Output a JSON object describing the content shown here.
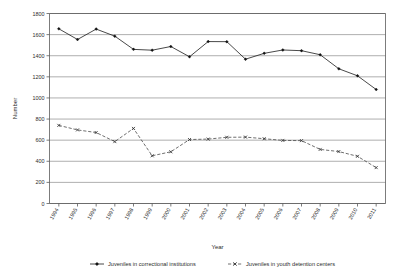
{
  "chart_data": {
    "type": "line",
    "title": "",
    "xlabel": "Year",
    "ylabel": "Number",
    "ylim": [
      0,
      1800
    ],
    "ytick_step": 200,
    "yticks": [
      0,
      200,
      400,
      600,
      800,
      1000,
      1200,
      1400,
      1600,
      1800
    ],
    "grid": true,
    "grid_axis": "y",
    "legend_position": "bottom",
    "categories": [
      "1994",
      "1995",
      "1996",
      "1997",
      "1998",
      "1999",
      "2000",
      "2001",
      "2002",
      "2003",
      "2004",
      "2005",
      "2006",
      "2007",
      "2008",
      "2009",
      "2010",
      "2011"
    ],
    "x": [
      "1994",
      "1995",
      "1996",
      "1997",
      "1998",
      "1999",
      "2000",
      "2001",
      "2002",
      "2003",
      "2004",
      "2005",
      "2006",
      "2007",
      "2008",
      "2009",
      "2010",
      "2011"
    ],
    "series": [
      {
        "name": "Juveniles in correctional institutions",
        "marker": "diamond",
        "line_style": "solid",
        "color": "#111111",
        "values": [
          1655,
          1575,
          1530,
          1660,
          1645,
          1500,
          1455,
          1440,
          1475,
          1490,
          1365,
          1450,
          1560,
          1605,
          1300,
          1395,
          1420,
          1435
        ]
      },
      {
        "name": "Juveniles in youth detention centers",
        "marker": "x",
        "line_style": "dashed",
        "color": "#333333",
        "values": [
          740,
          700,
          695,
          690,
          590,
          585,
          660,
          805,
          430,
          445,
          530,
          610,
          575,
          625,
          630,
          620,
          630,
          635
        ]
      }
    ],
    "series_extended_note": "",
    "annotations": []
  },
  "chart_data_full": {
    "series_1_values": [
      1655,
      1575,
      1530,
      1660,
      1645,
      1500,
      1455,
      1440,
      1475,
      1490,
      1365,
      1450,
      1560,
      1605,
      1300,
      1395,
      1420,
      1435,
      1465,
      1450,
      1430,
      1395,
      1280,
      1215,
      1205,
      1080
    ],
    "series_2_values": [
      740,
      700,
      695,
      690,
      590,
      585,
      660,
      805,
      430,
      445,
      530,
      610,
      575,
      625,
      630,
      620,
      630,
      635,
      590,
      600,
      560,
      615,
      530,
      455,
      500,
      480,
      400,
      340
    ]
  },
  "legend": {
    "items": [
      {
        "label": "Juveniles in correctional institutions",
        "marker": "diamond",
        "line_style": "solid"
      },
      {
        "label": "Juveniles in youth detention centers",
        "marker": "x",
        "line_style": "dashed"
      }
    ]
  },
  "axes": {
    "y_title": "Number",
    "x_title": "Year"
  }
}
